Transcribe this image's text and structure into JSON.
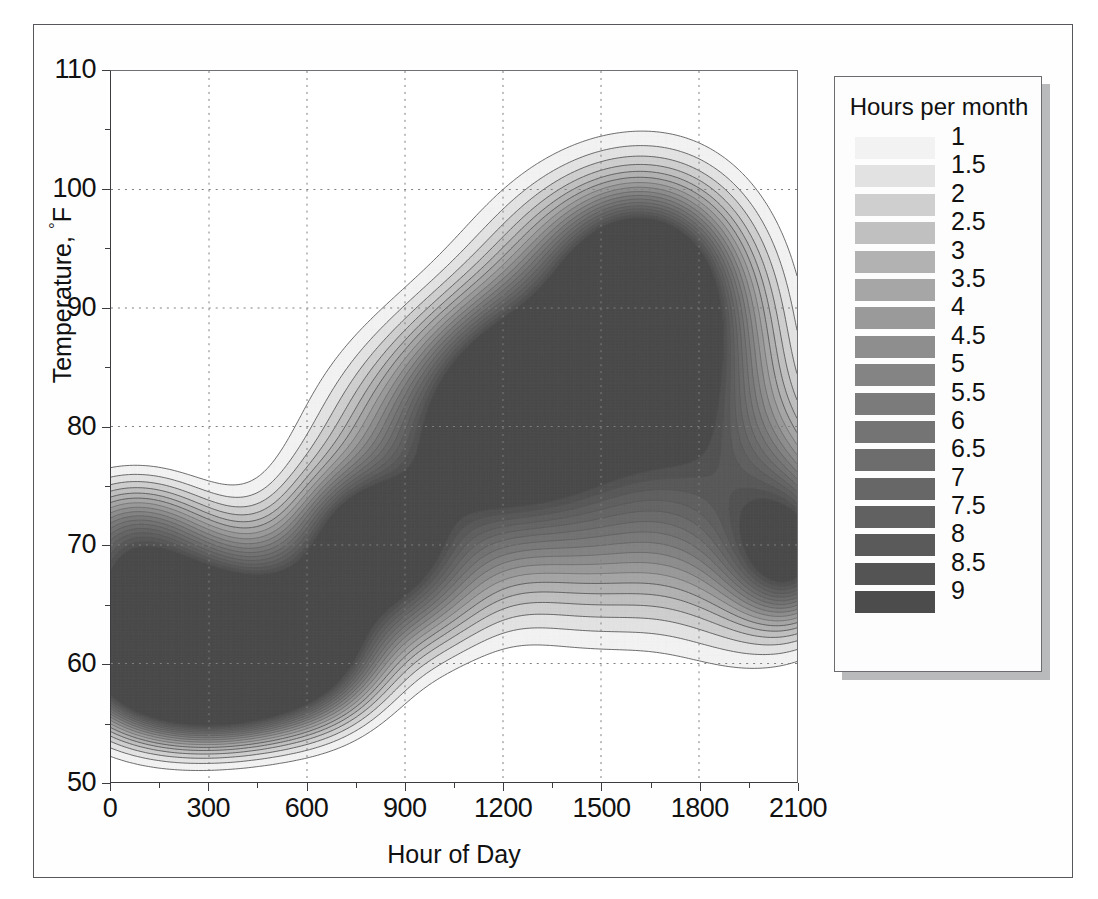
{
  "figure": {
    "chart_type": "contour",
    "background": "#ffffff",
    "frame_color": "#55575a"
  },
  "chart_data": {
    "type": "heatmap",
    "subtype": "filled-contour",
    "title": "",
    "xlabel": "Hour of Day",
    "ylabel": "Temperature, °F",
    "xlim": [
      0,
      2100
    ],
    "ylim": [
      50,
      110
    ],
    "xticks": [
      "0",
      "300",
      "600",
      "900",
      "1200",
      "1500",
      "1800",
      "2100"
    ],
    "xtick_values": [
      0,
      300,
      600,
      900,
      1200,
      1500,
      1800,
      2100
    ],
    "yticks": [
      "50",
      "60",
      "70",
      "80",
      "90",
      "100",
      "110"
    ],
    "ytick_values": [
      50,
      60,
      70,
      80,
      90,
      100,
      110
    ],
    "ytick_minor_values": [
      55,
      65,
      75,
      85,
      95,
      105
    ],
    "xtick_minor_values": [
      150,
      450,
      750,
      1050,
      1350,
      1650,
      1950
    ],
    "grid": true,
    "grid_style": "dotted",
    "legend_position": "right-outside",
    "legend_title": "Hours per month",
    "zunits": "hours per month",
    "levels": [
      1,
      1.5,
      2,
      2.5,
      3,
      3.5,
      4,
      4.5,
      5,
      5.5,
      6,
      6.5,
      7,
      7.5,
      8,
      8.5,
      9
    ],
    "level_labels": [
      "1",
      "1.5",
      "2",
      "2.5",
      "3",
      "3.5",
      "4",
      "4.5",
      "5",
      "5.5",
      "6",
      "6.5",
      "7",
      "7.5",
      "8",
      "8.5",
      "9"
    ],
    "level_colors": [
      "#f2f2f2",
      "#e2e2e2",
      "#cfcfcf",
      "#c0c0c0",
      "#b2b2b2",
      "#a6a6a6",
      "#9a9a9a",
      "#8e8e8e",
      "#848484",
      "#7b7b7b",
      "#747474",
      "#6d6d6d",
      "#676767",
      "#616161",
      "#5a5a5a",
      "#545454",
      "#4c4c4c"
    ],
    "contour_line_color": "#555555",
    "peaks": [
      {
        "x": 330,
        "y": 59.5,
        "z": 9,
        "note": "overnight/early-morning mode"
      },
      {
        "x": 800,
        "y": 71,
        "z": 5,
        "note": "morning local maximum"
      },
      {
        "x": 1250,
        "y": 83,
        "z": 6.5,
        "note": "midday secondary maximum"
      },
      {
        "x": 1620,
        "y": 92,
        "z": 8,
        "note": "late-afternoon peak"
      },
      {
        "x": 2080,
        "y": 69,
        "z": 5,
        "note": "late-evening ridge at right edge"
      }
    ],
    "envelope_note": "Occupied band rises from ~52-76 F overnight to ~62-104 F near hour 1600, then falls back toward ~58-78 F by hour 2100."
  },
  "axes": {
    "x_title": "Hour of Day",
    "y_title_prefix": "Temperature, ",
    "y_title_degree": "°",
    "y_title_unit": "F"
  },
  "legend": {
    "title": "Hours per month"
  }
}
